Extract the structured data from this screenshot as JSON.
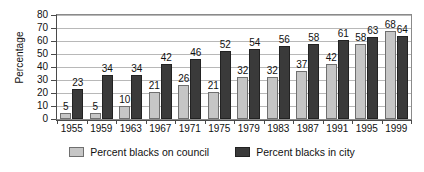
{
  "chart_data": {
    "type": "bar",
    "title": "",
    "xlabel": "",
    "ylabel": "Percentage",
    "ylim": [
      0,
      80
    ],
    "ytick_step": 10,
    "yticks": [
      0,
      10,
      20,
      30,
      40,
      50,
      60,
      70,
      80
    ],
    "grid": true,
    "legend_position": "bottom",
    "categories": [
      "1955",
      "1959",
      "1963",
      "1967",
      "1971",
      "1975",
      "1979",
      "1983",
      "1987",
      "1991",
      "1995",
      "1999"
    ],
    "series": [
      {
        "name": "Percent blacks on council",
        "color": "#c6c6c6",
        "values": [
          5,
          5,
          10,
          21,
          26,
          21,
          32,
          32,
          37,
          42,
          58,
          68
        ]
      },
      {
        "name": "Percent blacks in city",
        "color": "#3a3a3a",
        "values": [
          23,
          34,
          34,
          42,
          46,
          52,
          54,
          56,
          58,
          61,
          63,
          64
        ]
      }
    ]
  },
  "legend": {
    "items": [
      {
        "label": "Percent blacks on council",
        "swatch": "light"
      },
      {
        "label": "Percent blacks in city",
        "swatch": "dark"
      }
    ]
  }
}
